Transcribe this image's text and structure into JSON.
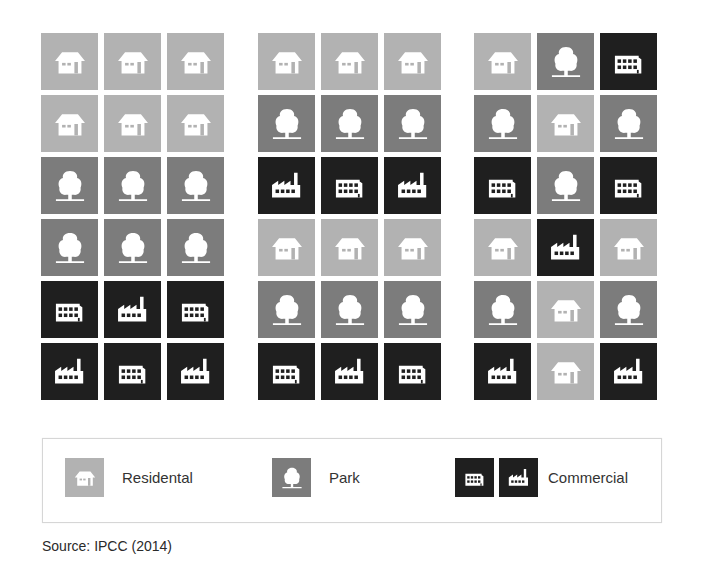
{
  "colors": {
    "residential": "#b2b2b2",
    "park": "#7c7c7c",
    "commercial": "#1f1f1f",
    "icon": "#ffffff"
  },
  "grids": [
    {
      "id": "scenario-1",
      "rows": [
        [
          "residential-house",
          "residential-house",
          "residential-house"
        ],
        [
          "residential-house",
          "residential-house",
          "residential-house"
        ],
        [
          "park-tree",
          "park-tree",
          "park-tree"
        ],
        [
          "park-tree",
          "park-tree",
          "park-tree"
        ],
        [
          "commercial-office",
          "commercial-factory",
          "commercial-office"
        ],
        [
          "commercial-factory",
          "commercial-office",
          "commercial-factory"
        ]
      ]
    },
    {
      "id": "scenario-2",
      "rows": [
        [
          "residential-house",
          "residential-house",
          "residential-house"
        ],
        [
          "park-tree",
          "park-tree",
          "park-tree"
        ],
        [
          "commercial-factory",
          "commercial-office",
          "commercial-factory"
        ],
        [
          "residential-house",
          "residential-house",
          "residential-house"
        ],
        [
          "park-tree",
          "park-tree",
          "park-tree"
        ],
        [
          "commercial-office",
          "commercial-factory",
          "commercial-office"
        ]
      ]
    },
    {
      "id": "scenario-3",
      "rows": [
        [
          "residential-house",
          "park-tree",
          "commercial-office"
        ],
        [
          "park-tree",
          "residential-house",
          "park-tree"
        ],
        [
          "commercial-office",
          "park-tree",
          "commercial-office"
        ],
        [
          "residential-house",
          "commercial-factory",
          "residential-house"
        ],
        [
          "park-tree",
          "residential-house",
          "park-tree"
        ],
        [
          "commercial-factory",
          "residential-house",
          "commercial-factory"
        ]
      ]
    }
  ],
  "legend": {
    "residential": {
      "label": "Residental",
      "icons": [
        "residential-house"
      ]
    },
    "park": {
      "label": "Park",
      "icons": [
        "park-tree"
      ]
    },
    "commercial": {
      "label": "Commercial",
      "icons": [
        "commercial-office",
        "commercial-factory"
      ]
    }
  },
  "source": "Source: IPCC (2014)"
}
